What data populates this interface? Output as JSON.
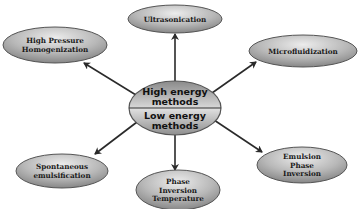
{
  "diagram": {
    "center": {
      "top_label": [
        "High energy",
        "methods"
      ],
      "bottom_label": [
        "Low energy",
        "methods"
      ]
    },
    "nodes": [
      {
        "id": "ultrasonication",
        "lines": [
          "Ultrasonication"
        ],
        "group": "high"
      },
      {
        "id": "high-pressure-homogenization",
        "lines": [
          "High Pressure",
          "Homogenization"
        ],
        "group": "high"
      },
      {
        "id": "microfluidization",
        "lines": [
          "Microfluidization"
        ],
        "group": "high"
      },
      {
        "id": "spontaneous-emulsification",
        "lines": [
          "Spontaneous",
          "emulsification"
        ],
        "group": "low"
      },
      {
        "id": "phase-inversion-temperature",
        "lines": [
          "Phase",
          "Inversion",
          "Temperature"
        ],
        "group": "low"
      },
      {
        "id": "emulsion-phase-inversion",
        "lines": [
          "Emulsion",
          "Phase",
          "Inversion"
        ],
        "group": "low"
      }
    ],
    "edges": [
      {
        "from": "center",
        "to": "ultrasonication"
      },
      {
        "from": "center",
        "to": "high-pressure-homogenization"
      },
      {
        "from": "center",
        "to": "microfluidization"
      },
      {
        "from": "center",
        "to": "spontaneous-emulsification"
      },
      {
        "from": "center",
        "to": "phase-inversion-temperature"
      },
      {
        "from": "center",
        "to": "emulsion-phase-inversion"
      }
    ],
    "colors": {
      "node_fill_light": "#e6e6e6",
      "node_fill_dark": "#8c8c8c",
      "node_stroke": "#555555",
      "edge": "#2a2a2a"
    }
  }
}
